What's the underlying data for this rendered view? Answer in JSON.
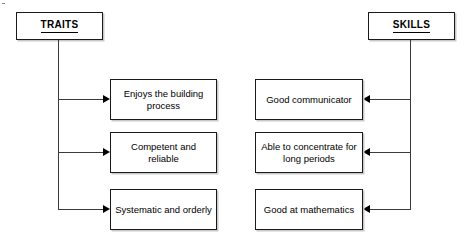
{
  "diagram": {
    "type": "two-column-branching-diagram",
    "background_color": "#ffffff",
    "line_color": "#3a3a3a",
    "text_color": "#000000",
    "shadow_color": "#c9c9c9",
    "left": {
      "header": "TRAITS",
      "items": [
        "Enjoys the building process",
        "Competent and reliable",
        "Systematic and orderly"
      ]
    },
    "right": {
      "header": "SKILLS",
      "items": [
        "Good communicator",
        "Able to concentrate for long periods",
        "Good at mathematics"
      ]
    }
  }
}
